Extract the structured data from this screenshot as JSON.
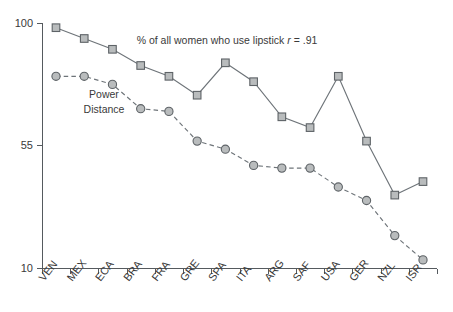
{
  "chart_data": {
    "type": "line",
    "title": "",
    "xlabel": "",
    "ylabel": "",
    "ylim": [
      10,
      100
    ],
    "yticks": [
      10,
      55,
      100
    ],
    "grid": false,
    "legend_position": "inline-annotation",
    "categories": [
      "VEN",
      "MEX",
      "ECA",
      "BRA",
      "FRA",
      "GRE",
      "SPA",
      "ITA",
      "ARG",
      "SAF",
      "USA",
      "GER",
      "NZL",
      "ISR"
    ],
    "series": [
      {
        "name": "% of all women who use lipstick",
        "marker": "square",
        "linestyle": "solid",
        "color": "#b9bcbd",
        "values": [
          99,
          95,
          91,
          85,
          81,
          74,
          86,
          79,
          66,
          62,
          81,
          57,
          37,
          42
        ]
      },
      {
        "name": "Power Distance",
        "marker": "circle",
        "linestyle": "dashed",
        "color": "#b9bcbd",
        "values": [
          81,
          81,
          78,
          69,
          68,
          57,
          54,
          48,
          47,
          47,
          40,
          35,
          22,
          13
        ]
      }
    ],
    "annotations": [
      {
        "name": "lipstick-annotation",
        "text_main": "% of all women who use lipstick ",
        "text_italic": "r",
        "text_tail": " = .91",
        "x": 227,
        "y": 44
      },
      {
        "name": "power-distance-label",
        "line1": "Power",
        "line2": "Distance",
        "x": 104,
        "y": 98
      }
    ]
  },
  "axes": {
    "y_tick_labels": [
      "100",
      "55",
      "10"
    ],
    "x_tick_labels": [
      "VEN",
      "MEX",
      "ECA",
      "BRA",
      "FRA",
      "GRE",
      "SPA",
      "ITA",
      "ARG",
      "SAF",
      "USA",
      "GER",
      "NZL",
      "ISR"
    ]
  },
  "colors": {
    "axis": "#555a5e",
    "line": "#6e7479",
    "marker_fill": "#b9bcbd",
    "marker_stroke": "#5e6367",
    "text": "#3a3a3a",
    "background": "#ffffff"
  }
}
